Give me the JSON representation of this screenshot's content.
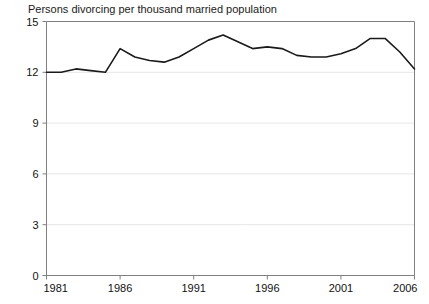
{
  "chart_data": {
    "type": "line",
    "title": "Persons divorcing per thousand married population",
    "xlabel": "",
    "ylabel": "",
    "xlim": [
      1981,
      2006
    ],
    "ylim": [
      0,
      15
    ],
    "yticks": [
      0,
      3,
      6,
      9,
      12,
      15
    ],
    "xticks": [
      1981,
      1986,
      1991,
      1996,
      2001,
      2006
    ],
    "grid": "horizontal-dotted",
    "legend": "none",
    "line_color": "#1a1a1a",
    "grid_color": "#cccccc",
    "axis_color": "#808080",
    "x": [
      1981,
      1982,
      1983,
      1984,
      1985,
      1986,
      1987,
      1988,
      1989,
      1990,
      1991,
      1992,
      1993,
      1994,
      1995,
      1996,
      1997,
      1998,
      1999,
      2000,
      2001,
      2002,
      2003,
      2004,
      2005,
      2006
    ],
    "values": [
      12.0,
      12.0,
      12.2,
      12.1,
      12.0,
      13.4,
      12.9,
      12.7,
      12.6,
      12.9,
      13.4,
      13.9,
      14.2,
      13.8,
      13.4,
      13.5,
      13.4,
      13.0,
      12.9,
      12.9,
      13.1,
      13.4,
      14.0,
      14.0,
      13.2,
      12.2
    ]
  }
}
